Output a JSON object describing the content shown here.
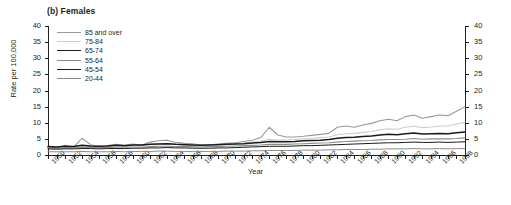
{
  "chart_data": {
    "type": "line",
    "title": "(b) Females",
    "xlabel": "Year",
    "ylabel": "Rate per 100,000",
    "ylim": [
      0,
      40
    ],
    "ytick_step": 5,
    "yticks": [
      0,
      5,
      10,
      15,
      20,
      25,
      30,
      35,
      40
    ],
    "xlim": [
      1950,
      1999
    ],
    "xtick_labels": [
      "1950",
      "1952",
      "1954",
      "1956",
      "1958",
      "1960",
      "1962",
      "1964",
      "1966",
      "1968",
      "1970",
      "1972",
      "1974",
      "1976",
      "1978",
      "1980",
      "1982",
      "1984",
      "1986",
      "1988",
      "1990",
      "1992",
      "1994",
      "1996",
      "1998"
    ],
    "grid": false,
    "legend_position": "top-left-inside",
    "x": [
      1950,
      1951,
      1952,
      1953,
      1954,
      1955,
      1956,
      1957,
      1958,
      1959,
      1960,
      1961,
      1962,
      1963,
      1964,
      1965,
      1966,
      1967,
      1968,
      1969,
      1970,
      1971,
      1972,
      1973,
      1974,
      1975,
      1976,
      1977,
      1978,
      1979,
      1980,
      1981,
      1982,
      1983,
      1984,
      1985,
      1986,
      1987,
      1988,
      1989,
      1990,
      1991,
      1992,
      1993,
      1994,
      1995,
      1996,
      1997,
      1998,
      1999
    ],
    "series": [
      {
        "name": "85 and over",
        "color": "#9a9a9a",
        "width": 1.1,
        "values": [
          2.6,
          2.2,
          3.0,
          2.4,
          5.2,
          3.2,
          2.6,
          2.9,
          3.3,
          3.1,
          3.4,
          3.0,
          4.0,
          4.4,
          4.6,
          3.9,
          3.6,
          3.5,
          3.1,
          3.2,
          3.4,
          3.6,
          3.8,
          4.2,
          4.6,
          5.4,
          8.6,
          6.2,
          5.6,
          5.6,
          5.8,
          6.1,
          6.4,
          6.7,
          8.6,
          9.0,
          8.6,
          9.3,
          9.8,
          10.6,
          11.1,
          10.6,
          11.9,
          12.4,
          11.4,
          11.9,
          12.4,
          12.2,
          13.6,
          15.0
        ]
      },
      {
        "name": "75-84",
        "color": "#cfcfcf",
        "width": 1.1,
        "values": [
          2.3,
          2.1,
          2.4,
          2.3,
          2.8,
          2.6,
          2.5,
          2.6,
          2.9,
          2.8,
          3.0,
          3.0,
          3.3,
          3.5,
          3.6,
          3.3,
          3.2,
          3.2,
          3.1,
          3.2,
          3.3,
          3.4,
          3.5,
          3.7,
          4.0,
          4.3,
          4.9,
          4.6,
          4.6,
          4.8,
          5.0,
          5.2,
          5.4,
          5.6,
          6.3,
          6.6,
          6.7,
          7.0,
          7.3,
          7.8,
          8.1,
          8.0,
          8.6,
          8.9,
          8.5,
          8.7,
          9.0,
          9.0,
          9.6,
          10.2
        ]
      },
      {
        "name": "65-74",
        "color": "#1a1a1a",
        "width": 1.5,
        "values": [
          2.6,
          2.5,
          2.7,
          2.6,
          3.0,
          2.8,
          2.7,
          2.8,
          3.0,
          2.9,
          3.1,
          3.1,
          3.3,
          3.4,
          3.5,
          3.3,
          3.2,
          3.1,
          3.0,
          3.1,
          3.2,
          3.3,
          3.4,
          3.5,
          3.7,
          3.9,
          4.2,
          4.1,
          4.1,
          4.2,
          4.4,
          4.5,
          4.6,
          4.8,
          5.2,
          5.4,
          5.5,
          5.7,
          5.9,
          6.2,
          6.4,
          6.3,
          6.6,
          6.8,
          6.5,
          6.6,
          6.7,
          6.6,
          6.9,
          7.1
        ]
      },
      {
        "name": "55-64",
        "color": "#8c8c8c",
        "width": 1.1,
        "values": [
          2.2,
          2.1,
          2.2,
          2.2,
          2.4,
          2.3,
          2.3,
          2.3,
          2.4,
          2.4,
          2.5,
          2.5,
          2.6,
          2.7,
          2.7,
          2.6,
          2.6,
          2.6,
          2.5,
          2.6,
          2.6,
          2.7,
          2.8,
          2.9,
          3.0,
          3.1,
          3.3,
          3.3,
          3.3,
          3.4,
          3.5,
          3.6,
          3.7,
          3.8,
          4.0,
          4.2,
          4.3,
          4.4,
          4.5,
          4.7,
          4.8,
          4.8,
          4.9,
          5.1,
          4.9,
          5.0,
          5.0,
          5.0,
          5.1,
          5.3
        ]
      },
      {
        "name": "45-54",
        "color": "#1a1a1a",
        "width": 1.0,
        "values": [
          1.9,
          1.8,
          1.9,
          1.9,
          2.0,
          2.0,
          1.9,
          2.0,
          2.0,
          2.0,
          2.1,
          2.1,
          2.2,
          2.2,
          2.3,
          2.2,
          2.2,
          2.1,
          2.1,
          2.1,
          2.2,
          2.2,
          2.3,
          2.4,
          2.5,
          2.6,
          2.7,
          2.7,
          2.7,
          2.8,
          2.9,
          2.9,
          3.0,
          3.1,
          3.2,
          3.3,
          3.4,
          3.5,
          3.6,
          3.7,
          3.8,
          3.8,
          3.9,
          4.0,
          3.9,
          3.9,
          4.0,
          3.9,
          4.0,
          4.1
        ]
      },
      {
        "name": "20-44",
        "color": "#8c8c8c",
        "width": 1.0,
        "values": [
          1.0,
          1.0,
          1.0,
          1.0,
          1.1,
          1.0,
          1.0,
          1.0,
          1.1,
          1.0,
          1.1,
          1.1,
          1.1,
          1.2,
          1.2,
          1.1,
          1.1,
          1.1,
          1.1,
          1.1,
          1.1,
          1.2,
          1.2,
          1.2,
          1.3,
          1.3,
          1.4,
          1.4,
          1.4,
          1.4,
          1.5,
          1.5,
          1.5,
          1.6,
          1.6,
          1.7,
          1.7,
          1.7,
          1.8,
          1.8,
          1.9,
          1.9,
          1.9,
          2.0,
          1.9,
          1.9,
          2.0,
          1.9,
          2.0,
          2.0
        ]
      }
    ]
  }
}
